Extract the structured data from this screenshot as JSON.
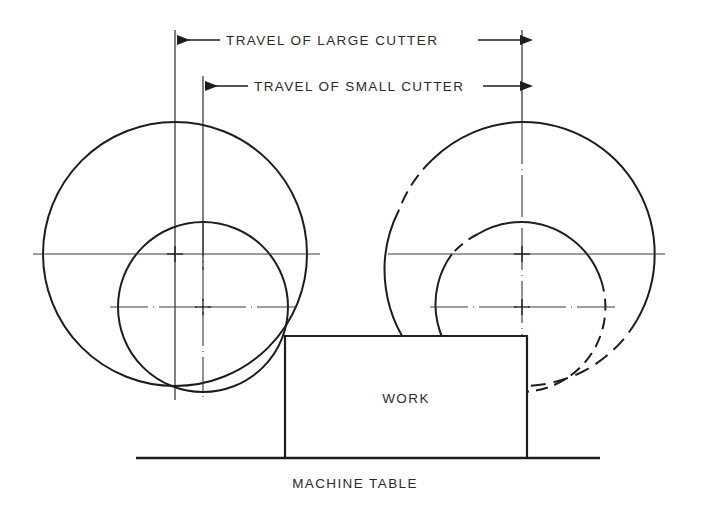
{
  "drawing": {
    "title_labels": {
      "travel_large": "TRAVEL OF LARGE CUTTER",
      "travel_small": "TRAVEL OF SMALL CUTTER",
      "work": "WORK",
      "machine_table": "MACHINE TABLE"
    },
    "colors": {
      "ink": "#1d1d1d",
      "ink_light": "#3a3a3a",
      "text": "#2b2b2b",
      "background": "#ffffff"
    },
    "geometry": {
      "large_cutter_radius": 132,
      "small_cutter_radius": 85,
      "left_group": {
        "large_center": {
          "x": 175,
          "y": 254
        },
        "small_center": {
          "x": 203,
          "y": 307
        }
      },
      "right_group": {
        "large_center": {
          "x": 522,
          "y": 254
        },
        "small_center": {
          "x": 522,
          "y": 307
        }
      },
      "work_block": {
        "x": 285,
        "y": 336,
        "width": 242,
        "height": 122
      },
      "machine_table": {
        "x1": 136,
        "x2": 600,
        "y": 458
      },
      "dimension_lines": {
        "large_cutter": {
          "y": 40,
          "left_x": 175,
          "right_x": 522
        },
        "small_cutter": {
          "y": 86,
          "left_x": 203,
          "right_x": 522
        }
      }
    }
  }
}
